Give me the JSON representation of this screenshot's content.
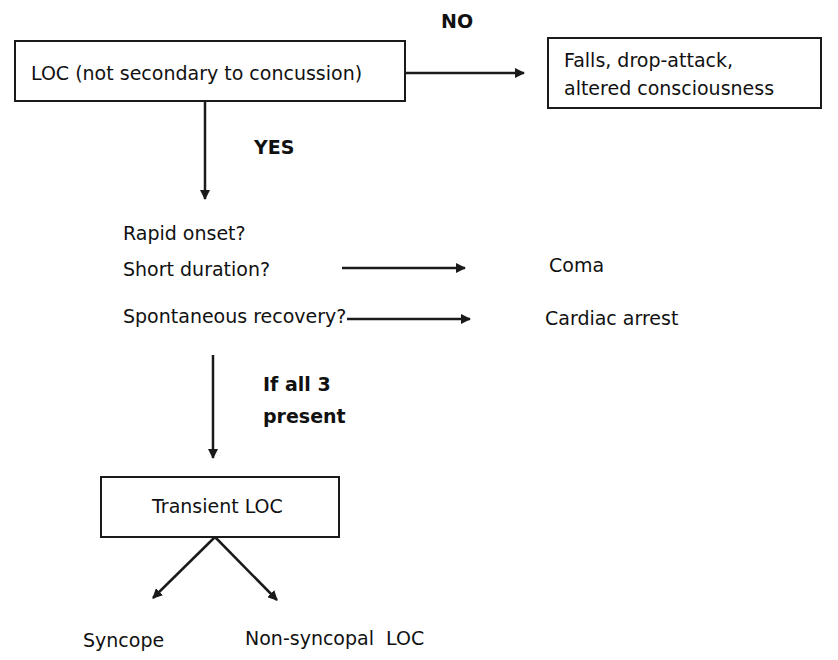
{
  "diagram": {
    "type": "flowchart",
    "nodes": {
      "loc": "LOC (not secondary to concussion)",
      "falls_line1": "Falls, drop-attack,",
      "falls_line2": "altered consciousness",
      "q1": "Rapid onset?",
      "q2": "Short duration?",
      "q3": "Spontaneous recovery?",
      "coma": "Coma",
      "cardiac": "Cardiac arrest",
      "transient": "Transient LOC",
      "syncope": "Syncope",
      "nonsyncopal": "Non-syncopal  LOC"
    },
    "edge_labels": {
      "no": "NO",
      "yes": "YES",
      "if_all_line1": "If all 3",
      "if_all_line2": "present"
    },
    "edges": [
      {
        "from": "loc",
        "to": "falls",
        "label": "NO"
      },
      {
        "from": "loc",
        "to": "questions",
        "label": "YES"
      },
      {
        "from": "q2",
        "to": "coma"
      },
      {
        "from": "q3",
        "to": "cardiac"
      },
      {
        "from": "questions",
        "to": "transient",
        "label": "If all 3 present"
      },
      {
        "from": "transient",
        "to": "syncope"
      },
      {
        "from": "transient",
        "to": "nonsyncopal"
      }
    ],
    "colors": {
      "line": "#1a1a1a",
      "background": "#ffffff"
    }
  }
}
